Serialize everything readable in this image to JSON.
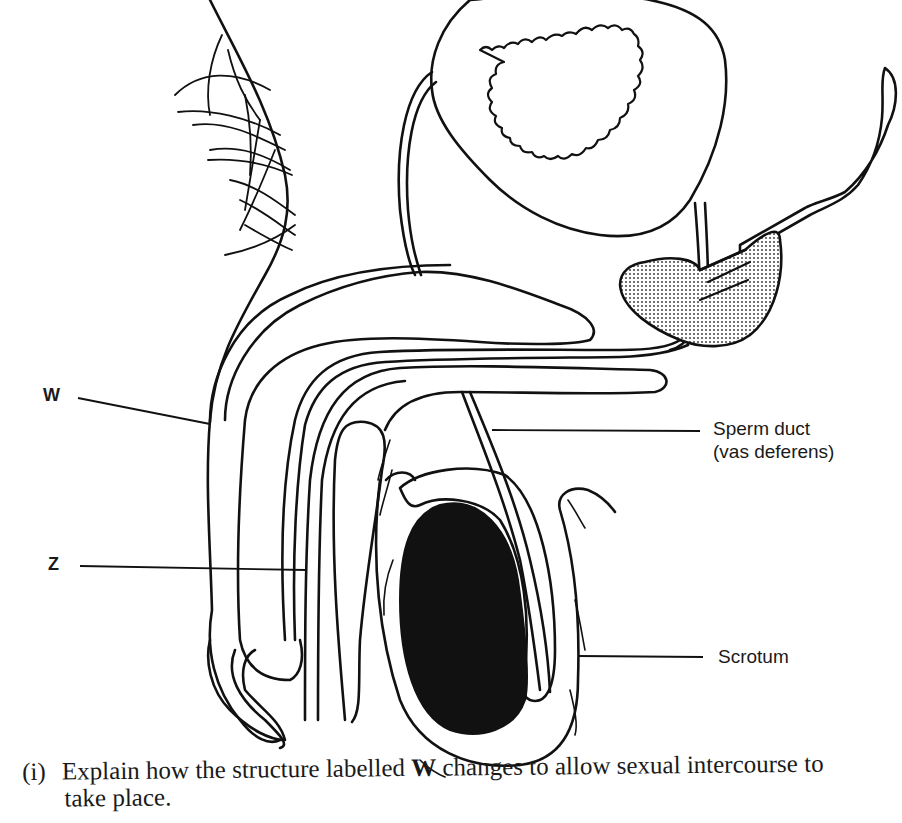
{
  "figure": {
    "labels": {
      "w": "W",
      "z": "Z",
      "sperm_duct_line1": "Sperm duct",
      "sperm_duct_line2": "(vas deferens)",
      "scrotum": "Scrotum"
    },
    "colors": {
      "ink": "#111111",
      "paper": "#ffffff",
      "gland_fill": "#d4d4d4"
    }
  },
  "question": {
    "number": "(i)",
    "text_before": "Explain how the structure labelled",
    "bold_ref": "W",
    "text_after": "changes to allow sexual intercourse to",
    "text_line2": "take place."
  }
}
